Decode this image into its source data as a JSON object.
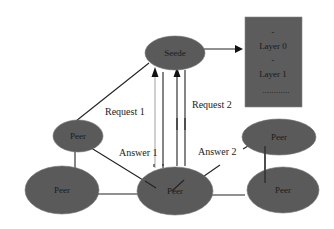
{
  "diagram": {
    "colors": {
      "node_fill": "#5a5a5a",
      "box_fill": "#5c5c5c",
      "line": "#222222",
      "line_light": "#aaaaaa",
      "background": "#ffffff"
    },
    "nodes": {
      "seede": {
        "label": "Seede"
      },
      "peer_top_left": {
        "label": "Peer"
      },
      "peer_bottom_left": {
        "label": "Peer"
      },
      "peer_bottom_center": {
        "label": "Peer"
      },
      "peer_right_top": {
        "label": "Peer"
      },
      "peer_right_bottom": {
        "label": "Peer"
      }
    },
    "layer_box": {
      "dot1": "-",
      "layer0": "Layer 0",
      "dot2": "-",
      "layer1": "Layer 1",
      "ellipsis": "............"
    },
    "edge_labels": {
      "request1": "Request 1",
      "request2": "Request  2",
      "answer1": "Answer 1",
      "answer2": "Answer 2"
    }
  }
}
